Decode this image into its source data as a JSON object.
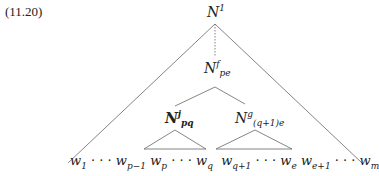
{
  "example_number": "(11.20)",
  "nodes": {
    "root": {
      "base": "N",
      "sup": "1",
      "sub": ""
    },
    "mid": {
      "base": "N",
      "sup": "f",
      "sub": "pe"
    },
    "left": {
      "base": "N",
      "sup": "j",
      "sub": "pq"
    },
    "right": {
      "base": "N",
      "sup": "g",
      "sub": "(q+1)e"
    }
  },
  "terminals": {
    "w1": {
      "base": "w",
      "sub": "1"
    },
    "dots1": "· · ·",
    "wp1": {
      "base": "w",
      "sub": "p−1"
    },
    "wp": {
      "base": "w",
      "sub": "p"
    },
    "dots2": "· · ·",
    "wq": {
      "base": "w",
      "sub": "q"
    },
    "wq1": {
      "base": "w",
      "sub": "q+1"
    },
    "dots3": "· · ·",
    "we": {
      "base": "w",
      "sub": "e"
    },
    "we1": {
      "base": "w",
      "sub": "e+1"
    },
    "dots4": "· · ·",
    "wm": {
      "base": "w",
      "sub": "m"
    }
  }
}
